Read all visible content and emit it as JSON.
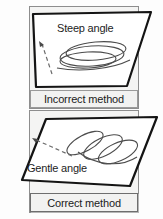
{
  "figure": {
    "background_color": "#fdfdfd",
    "ink_color": "#1b1b1b",
    "panel_fill": "#ffffff",
    "card_fill": "#f4f4f3"
  },
  "panels": [
    {
      "id": "incorrect",
      "angle_label": "Steep angle",
      "caption": "Incorrect method",
      "plane_outline_color": "#141414",
      "plane_fill": "#ffffff",
      "ellipse_count": 3,
      "has_dashed_arrow": true,
      "arrow_direction": "up-left"
    },
    {
      "id": "correct",
      "angle_label": "Gentle angle",
      "caption": "Correct method",
      "plane_outline_color": "#141414",
      "plane_fill": "#ffffff",
      "ellipse_count": 3,
      "has_dashed_arrow": true,
      "arrow_direction": "up-left"
    }
  ]
}
